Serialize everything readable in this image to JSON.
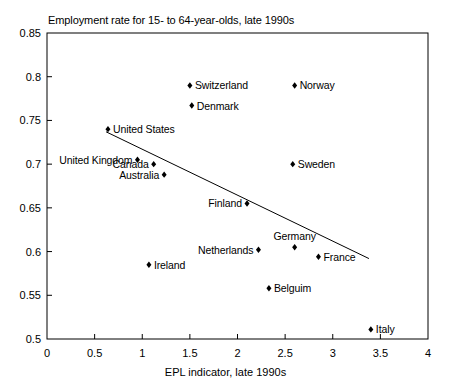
{
  "chart_data": {
    "type": "scatter",
    "title": "Employment rate for 15- to 64-year-olds, late 1990s",
    "xlabel": "EPL indicator, late 1990s",
    "ylabel": "",
    "xlim": [
      0,
      4
    ],
    "ylim": [
      0.5,
      0.85
    ],
    "xticks": [
      "0",
      "0.5",
      "1",
      "1.5",
      "2",
      "2.5",
      "3",
      "3.5",
      "4"
    ],
    "xtick_values": [
      0,
      0.5,
      1,
      1.5,
      2,
      2.5,
      3,
      3.5,
      4
    ],
    "yticks": [
      "0.5",
      "0.55",
      "0.6",
      "0.65",
      "0.7",
      "0.75",
      "0.8",
      "0.85"
    ],
    "ytick_values": [
      0.5,
      0.55,
      0.6,
      0.65,
      0.7,
      0.75,
      0.8,
      0.85
    ],
    "grid": false,
    "legend": "none",
    "marker": "diamond",
    "marker_color": "#000000",
    "trendline": {
      "visible": true,
      "color": "#000000",
      "x_start": 0.62,
      "y_start": 0.737,
      "x_end": 3.38,
      "y_end": 0.592
    },
    "points": [
      {
        "label": "Switzerland",
        "x": 1.5,
        "y": 0.79,
        "label_pos": "right"
      },
      {
        "label": "Norway",
        "x": 2.6,
        "y": 0.79,
        "label_pos": "right"
      },
      {
        "label": "Denmark",
        "x": 1.52,
        "y": 0.767,
        "label_pos": "right"
      },
      {
        "label": "United States",
        "x": 0.64,
        "y": 0.74,
        "label_pos": "right"
      },
      {
        "label": "United Kingdom",
        "x": 0.95,
        "y": 0.705,
        "label_pos": "left"
      },
      {
        "label": "Canada",
        "x": 1.12,
        "y": 0.7,
        "label_pos": "left"
      },
      {
        "label": "Australia",
        "x": 1.23,
        "y": 0.688,
        "label_pos": "left"
      },
      {
        "label": "Sweden",
        "x": 2.58,
        "y": 0.7,
        "label_pos": "right"
      },
      {
        "label": "Finland",
        "x": 2.1,
        "y": 0.655,
        "label_pos": "left"
      },
      {
        "label": "Germany",
        "x": 2.6,
        "y": 0.605,
        "label_pos": "above"
      },
      {
        "label": "Netherlands",
        "x": 2.22,
        "y": 0.602,
        "label_pos": "left"
      },
      {
        "label": "France",
        "x": 2.85,
        "y": 0.594,
        "label_pos": "right"
      },
      {
        "label": "Ireland",
        "x": 1.07,
        "y": 0.585,
        "label_pos": "right"
      },
      {
        "label": "Belguim",
        "x": 2.33,
        "y": 0.558,
        "label_pos": "right"
      },
      {
        "label": "Italy",
        "x": 3.4,
        "y": 0.511,
        "label_pos": "right"
      }
    ]
  }
}
